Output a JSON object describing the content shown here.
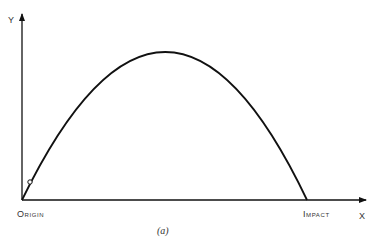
{
  "diagram": {
    "axes": {
      "x_label": "X",
      "y_label": "Y"
    },
    "points": {
      "origin_label": "Origin",
      "impact_label": "Impact"
    },
    "caption": "(a)",
    "curve": "parabolic trajectory from origin to impact",
    "colors": {
      "line": "#111111",
      "text": "#333333",
      "background": "#ffffff"
    }
  }
}
